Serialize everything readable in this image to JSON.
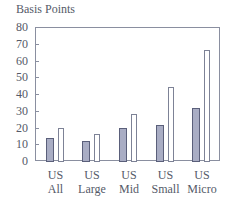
{
  "chart_data": {
    "type": "bar",
    "title": "",
    "ylabel": "Basis Points",
    "xlabel": "",
    "ylim": [
      0,
      80
    ],
    "yticks": [
      0,
      10,
      20,
      30,
      40,
      50,
      60,
      70,
      80
    ],
    "categories": [
      "US All",
      "US Large",
      "US Mid",
      "US Small",
      "US Micro"
    ],
    "category_lines": [
      [
        "US",
        "All"
      ],
      [
        "US",
        "Large"
      ],
      [
        "US",
        "Mid"
      ],
      [
        "US",
        "Small"
      ],
      [
        "US",
        "Micro"
      ]
    ],
    "series": [
      {
        "name": "Series 1 (shaded)",
        "style": "filled",
        "values": [
          13.5,
          12,
          20,
          21.5,
          31.5
        ]
      },
      {
        "name": "Series 2 (open)",
        "style": "open",
        "values": [
          19.5,
          16,
          28,
          44,
          66
        ]
      }
    ],
    "legend": null,
    "grid": false
  },
  "colors": {
    "filled_bar": "#a9adc4",
    "filled_bar_border": "#5a5f7a",
    "open_bar_border": "#7d8296",
    "axis": "#8a8fa0",
    "text": "#555a68"
  }
}
